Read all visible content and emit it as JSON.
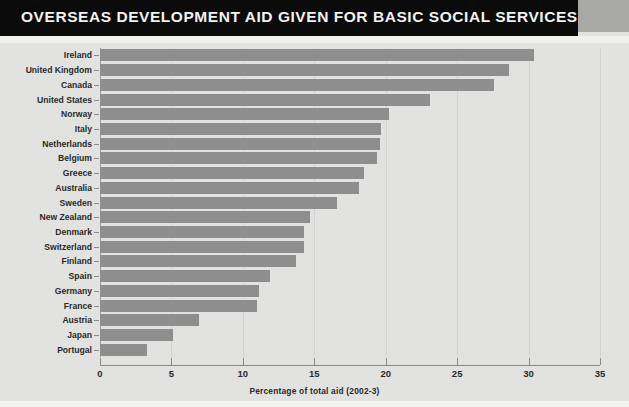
{
  "title": "OVERSEAS DEVELOPMENT AID GIVEN FOR BASIC SOCIAL SERVICES",
  "colors": {
    "bar": "#8e8e8e",
    "background": "#e2e2e0",
    "title_bar": "#0b0b0b",
    "title_text": "#f2f2f0",
    "axis": "#8a8a88",
    "grid": "#d2d2d0"
  },
  "chart_data": {
    "type": "bar",
    "orientation": "horizontal",
    "title": "OVERSEAS DEVELOPMENT AID GIVEN FOR BASIC SOCIAL SERVICES",
    "xlabel": "Percentage of total aid (2002-3)",
    "ylabel": "",
    "xlim": [
      0,
      35
    ],
    "xticks": [
      0,
      5,
      10,
      15,
      20,
      25,
      30,
      35
    ],
    "xtick_labels": [
      "0",
      "5",
      "10",
      "15",
      "20",
      "25",
      "30",
      "35"
    ],
    "grid": true,
    "legend": false,
    "categories": [
      "Ireland",
      "United Kingdom",
      "Canada",
      "United States",
      "Norway",
      "Italy",
      "Netherlands",
      "Belgium",
      "Greece",
      "Australia",
      "Sweden",
      "New Zealand",
      "Denmark",
      "Switzerland",
      "Finland",
      "Spain",
      "Germany",
      "France",
      "Austria",
      "Japan",
      "Portugal"
    ],
    "values": [
      30.4,
      28.6,
      27.6,
      23.1,
      20.2,
      19.7,
      19.6,
      19.4,
      18.5,
      18.1,
      16.6,
      14.7,
      14.3,
      14.3,
      13.7,
      11.9,
      11.1,
      11.0,
      6.9,
      5.1,
      3.3
    ]
  }
}
